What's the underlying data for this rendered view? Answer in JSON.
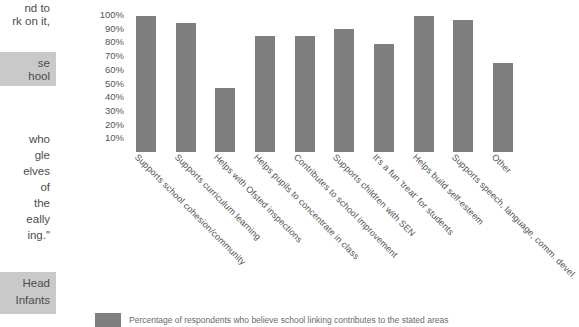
{
  "sidebar": {
    "fragments": [
      {
        "text": "nd to",
        "x": 0,
        "y": 2,
        "highlight": false
      },
      {
        "text": "rk on it,",
        "x": 0,
        "y": 15,
        "highlight": false
      },
      {
        "text": "se",
        "x": 0,
        "y": 57,
        "highlight": true
      },
      {
        "text": "hool",
        "x": 0,
        "y": 70,
        "highlight": true
      },
      {
        "text": "who",
        "x": 0,
        "y": 133,
        "highlight": false
      },
      {
        "text": "gle",
        "x": 0,
        "y": 149,
        "highlight": false
      },
      {
        "text": "elves",
        "x": 0,
        "y": 165,
        "highlight": false
      },
      {
        "text": "of",
        "x": 0,
        "y": 181,
        "highlight": false
      },
      {
        "text": "the",
        "x": 0,
        "y": 197,
        "highlight": false
      },
      {
        "text": "eally",
        "x": 0,
        "y": 213,
        "highlight": false
      },
      {
        "text": "ing.\"",
        "x": 0,
        "y": 229,
        "highlight": false
      },
      {
        "text": "Head",
        "x": 0,
        "y": 277,
        "highlight": true
      },
      {
        "text": "Infants",
        "x": 0,
        "y": 294,
        "highlight": true
      }
    ],
    "highlight_blocks": [
      {
        "y": 52,
        "height": 34
      },
      {
        "y": 272,
        "height": 42
      }
    ]
  },
  "legend": {
    "swatch_color": "#7f7f7f",
    "label": "Percentage of respondents who believe school linking contributes to the stated areas"
  },
  "chart_data": {
    "type": "bar",
    "title": "",
    "subtitle": "",
    "xlabel": "",
    "ylabel": "",
    "ylim": [
      0,
      100
    ],
    "grid": false,
    "legend_position": "bottom-left",
    "bar_color": "#7f7f7f",
    "ytick_labels": [
      "100%",
      "90%",
      "80%",
      "70%",
      "60%",
      "50%",
      "40%",
      "30%",
      "20%",
      "10%"
    ],
    "ytick_values": [
      100,
      90,
      80,
      70,
      60,
      50,
      40,
      30,
      20,
      10
    ],
    "categories": [
      "Supports school cohesion/community",
      "Supports curriculum learning",
      "Helps with Ofsted inspections",
      "Helps pupils to concentrate in class",
      "Contributes to school improvement",
      "Supports children with SEN",
      "It's a fun 'treat' for students",
      "Helps build self-esteem",
      "Supports speech, language, comm. devel.",
      "Other"
    ],
    "values": [
      99,
      94,
      47,
      85,
      85,
      90,
      79,
      99,
      96,
      65
    ],
    "series": [
      {
        "name": "Percentage of respondents who believe school linking contributes to the stated areas",
        "values": [
          99,
          94,
          47,
          85,
          85,
          90,
          79,
          99,
          96,
          65
        ]
      }
    ]
  }
}
